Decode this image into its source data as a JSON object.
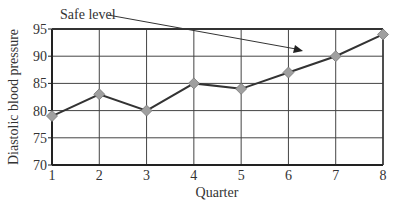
{
  "chart_data": {
    "type": "line",
    "title": "",
    "xlabel": "Quarter",
    "ylabel": "Diastolic blood pressure",
    "categories": [
      "1",
      "2",
      "3",
      "4",
      "5",
      "6",
      "7",
      "8"
    ],
    "x": [
      1,
      2,
      3,
      4,
      5,
      6,
      7,
      8
    ],
    "series": [
      {
        "name": "Diastolic blood pressure",
        "values": [
          79,
          83,
          80,
          85,
          84,
          87,
          90,
          94
        ],
        "color": "#333333",
        "marker": "diamond",
        "marker_color": "#a0a0a0"
      }
    ],
    "ylim": [
      70,
      95
    ],
    "yticks": [
      70,
      75,
      80,
      85,
      90,
      95
    ],
    "xticks": [
      1,
      2,
      3,
      4,
      5,
      6,
      7,
      8
    ],
    "grid": true,
    "legend": "none",
    "annotations": [
      {
        "text": "Safe level",
        "type": "arrow",
        "points_to": "95 gridline region near quarter 6"
      }
    ]
  },
  "annotation": {
    "text": "Safe level"
  },
  "axes": {
    "xlabel": "Quarter",
    "ylabel": "Diastolic blood pressure"
  }
}
